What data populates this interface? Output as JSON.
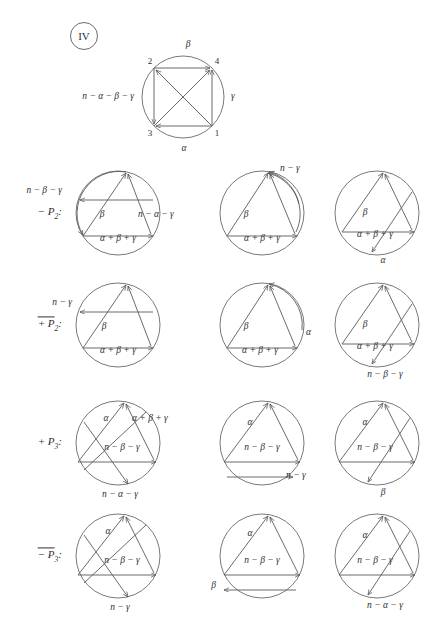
{
  "figure": {
    "panel_tag": "IV",
    "background": "#ffffff",
    "ink": "#5a5a5a"
  },
  "top_diagram": {
    "name": "square-in-circle",
    "vertices": [
      {
        "id": "2",
        "label": "2",
        "pos": "top-left"
      },
      {
        "id": "4",
        "label": "4",
        "pos": "top-right"
      },
      {
        "id": "3",
        "label": "3",
        "pos": "bottom-left"
      },
      {
        "id": "1",
        "label": "1",
        "pos": "bottom-right"
      }
    ],
    "outer_labels": [
      {
        "text": "β",
        "pos": "top"
      },
      {
        "text": "γ",
        "pos": "right"
      },
      {
        "text": "α",
        "pos": "bottom"
      },
      {
        "text": "n − α − β − γ",
        "pos": "left"
      }
    ]
  },
  "rows": [
    {
      "label": "− P",
      "label_sub": "2",
      "label_bar": false,
      "label_suffix": ":",
      "cells": [
        {
          "name": "cell-r1c1",
          "labels": [
            {
              "text": "n − β − γ",
              "x": -56,
              "y": -22,
              "anchor": "r"
            },
            {
              "text": "β",
              "x": -16,
              "y": 2,
              "anchor": "c"
            },
            {
              "text": "n − α − γ",
              "x": 20,
              "y": 2,
              "anchor": "l"
            },
            {
              "text": "α + β + γ",
              "x": 0,
              "y": 26,
              "anchor": "c"
            }
          ]
        },
        {
          "name": "cell-r1c2",
          "labels": [
            {
              "text": "n − γ",
              "x": 18,
              "y": -44,
              "anchor": "l"
            },
            {
              "text": "β",
              "x": -16,
              "y": 2,
              "anchor": "c"
            },
            {
              "text": "α + β + γ",
              "x": 0,
              "y": 26,
              "anchor": "c"
            }
          ]
        },
        {
          "name": "cell-r1c3",
          "labels": [
            {
              "text": "β",
              "x": -12,
              "y": 0,
              "anchor": "c"
            },
            {
              "text": "α + β + γ",
              "x": -2,
              "y": 22,
              "anchor": "c"
            },
            {
              "text": "α",
              "x": 6,
              "y": 48,
              "anchor": "c"
            }
          ]
        }
      ]
    },
    {
      "label": "+ P",
      "label_sub": "2",
      "label_bar": true,
      "label_suffix": ":",
      "cells": [
        {
          "name": "cell-r2c1",
          "labels": [
            {
              "text": "n − γ",
              "x": -46,
              "y": -22,
              "anchor": "r"
            },
            {
              "text": "β",
              "x": -14,
              "y": 2,
              "anchor": "c"
            },
            {
              "text": "α + β + γ",
              "x": 0,
              "y": 26,
              "anchor": "c"
            }
          ]
        },
        {
          "name": "cell-r2c2",
          "labels": [
            {
              "text": "β",
              "x": -16,
              "y": 2,
              "anchor": "c"
            },
            {
              "text": "α",
              "x": 44,
              "y": 8,
              "anchor": "l"
            },
            {
              "text": "α + β + γ",
              "x": -2,
              "y": 26,
              "anchor": "c"
            }
          ]
        },
        {
          "name": "cell-r2c3",
          "labels": [
            {
              "text": "β",
              "x": -12,
              "y": 0,
              "anchor": "c"
            },
            {
              "text": "α + β + γ",
              "x": -2,
              "y": 22,
              "anchor": "c"
            },
            {
              "text": "n − β − γ",
              "x": 8,
              "y": 50,
              "anchor": "c"
            }
          ]
        }
      ]
    },
    {
      "label": "+ P",
      "label_sub": "3",
      "label_bar": false,
      "label_suffix": ":",
      "cells": [
        {
          "name": "cell-r3c1",
          "labels": [
            {
              "text": "α",
              "x": -12,
              "y": -24,
              "anchor": "c"
            },
            {
              "text": "α + β + γ",
              "x": 14,
              "y": -24,
              "anchor": "l"
            },
            {
              "text": "n − β − γ",
              "x": 4,
              "y": 5,
              "anchor": "c"
            },
            {
              "text": "n − α − γ",
              "x": 2,
              "y": 52,
              "anchor": "c"
            }
          ]
        },
        {
          "name": "cell-r3c2",
          "labels": [
            {
              "text": "α",
              "x": -12,
              "y": -20,
              "anchor": "c"
            },
            {
              "text": "n − β − γ",
              "x": 0,
              "y": 5,
              "anchor": "c"
            },
            {
              "text": "n − γ",
              "x": 24,
              "y": 33,
              "anchor": "l"
            }
          ]
        },
        {
          "name": "cell-r3c3",
          "labels": [
            {
              "text": "α",
              "x": -12,
              "y": -20,
              "anchor": "c"
            },
            {
              "text": "n − β − γ",
              "x": -2,
              "y": 5,
              "anchor": "c"
            },
            {
              "text": "β",
              "x": 6,
              "y": 50,
              "anchor": "c"
            }
          ]
        }
      ]
    },
    {
      "label": "− P",
      "label_sub": "3",
      "label_bar": true,
      "label_suffix": ":",
      "cells": [
        {
          "name": "cell-r4c1",
          "labels": [
            {
              "text": "α",
              "x": -10,
              "y": -24,
              "anchor": "c"
            },
            {
              "text": "n − β − γ",
              "x": 4,
              "y": 5,
              "anchor": "c"
            },
            {
              "text": "n − γ",
              "x": 2,
              "y": 52,
              "anchor": "c"
            }
          ]
        },
        {
          "name": "cell-r4c2",
          "labels": [
            {
              "text": "α",
              "x": -12,
              "y": -22,
              "anchor": "c"
            },
            {
              "text": "n − β − γ",
              "x": 0,
              "y": 5,
              "anchor": "c"
            },
            {
              "text": "β",
              "x": -46,
              "y": 30,
              "anchor": "r"
            }
          ]
        },
        {
          "name": "cell-r4c3",
          "labels": [
            {
              "text": "α",
              "x": -12,
              "y": -20,
              "anchor": "c"
            },
            {
              "text": "n − β − γ",
              "x": -2,
              "y": 5,
              "anchor": "c"
            },
            {
              "text": "n − α − γ",
              "x": 8,
              "y": 50,
              "anchor": "c"
            }
          ]
        }
      ]
    }
  ],
  "layout": {
    "circle_radius": 42,
    "columns_x": [
      118,
      262,
      377
    ],
    "rows_y": [
      213,
      325,
      443,
      556
    ],
    "row_label_x": 62,
    "top_circle": {
      "cx": 183,
      "cy": 97,
      "r": 41
    }
  }
}
